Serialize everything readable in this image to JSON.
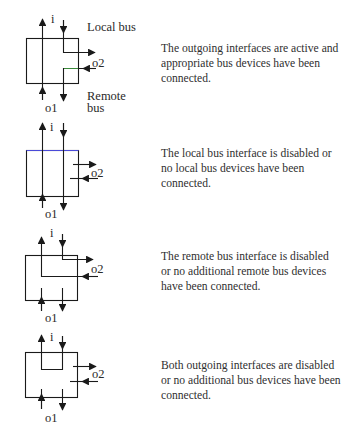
{
  "panels": [
    {
      "state": "both-active",
      "labels": {
        "input": "i",
        "local": "Local bus",
        "output2": "o2",
        "output1": "o1",
        "remote": "Remote",
        "remote2": "bus"
      },
      "description": "The outgoing interfaces are active and appropriate bus devices have been connected."
    },
    {
      "state": "local-disabled",
      "labels": {
        "input": "i",
        "output2": "o2",
        "output1": "o1"
      },
      "description": "The local bus interface is disabled or no local bus devices have been connected."
    },
    {
      "state": "remote-disabled",
      "labels": {
        "input": "i",
        "output2": "o2",
        "output1": "o1"
      },
      "description": "The remote bus interface is disabled or no additional remote bus devices have been connected."
    },
    {
      "state": "both-disabled",
      "labels": {
        "input": "i",
        "output2": "o2",
        "output1": "o1"
      },
      "description": "Both outgoing interfaces are disabled or no additional bus devices have been connected."
    }
  ],
  "colors": {
    "line": "#1a1a1a",
    "accent_blue": "#4a4ad8",
    "accent_green": "#3a8a3a"
  }
}
